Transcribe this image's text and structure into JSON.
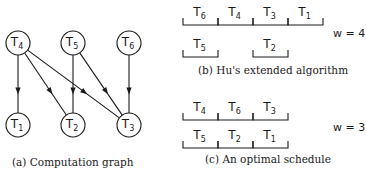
{
  "graph": {
    "caption": "(a) Computation graph",
    "nodes": [
      {
        "id": "T4",
        "main": "T",
        "sub": "4",
        "x": 18,
        "y": 43
      },
      {
        "id": "T5",
        "main": "T",
        "sub": "5",
        "x": 73,
        "y": 43
      },
      {
        "id": "T6",
        "main": "T",
        "sub": "6",
        "x": 129,
        "y": 43
      },
      {
        "id": "T1",
        "main": "T",
        "sub": "1",
        "x": 18,
        "y": 125
      },
      {
        "id": "T2",
        "main": "T",
        "sub": "2",
        "x": 73,
        "y": 125
      },
      {
        "id": "T3",
        "main": "T",
        "sub": "3",
        "x": 129,
        "y": 125
      }
    ],
    "edges": [
      {
        "from": "T4",
        "to": "T1"
      },
      {
        "from": "T4",
        "to": "T2"
      },
      {
        "from": "T4",
        "to": "T3"
      },
      {
        "from": "T5",
        "to": "T2"
      },
      {
        "from": "T5",
        "to": "T3"
      },
      {
        "from": "T6",
        "to": "T3"
      }
    ]
  },
  "schedule_b": {
    "caption": "(b) Hu's extended algorithm",
    "width_label": "w = 4",
    "row1": [
      {
        "main": "T",
        "sub": "6"
      },
      {
        "main": "T",
        "sub": "4"
      },
      {
        "main": "T",
        "sub": "3"
      },
      {
        "main": "T",
        "sub": "1"
      }
    ],
    "row2": [
      {
        "main": "T",
        "sub": "5",
        "slot": 0
      },
      {
        "main": "T",
        "sub": "2",
        "slot": 2
      }
    ]
  },
  "schedule_c": {
    "caption": "(c) An optimal schedule",
    "width_label": "w = 3",
    "row1": [
      {
        "main": "T",
        "sub": "4"
      },
      {
        "main": "T",
        "sub": "6"
      },
      {
        "main": "T",
        "sub": "3"
      }
    ],
    "row2": [
      {
        "main": "T",
        "sub": "5"
      },
      {
        "main": "T",
        "sub": "2"
      },
      {
        "main": "T",
        "sub": "1"
      }
    ]
  }
}
